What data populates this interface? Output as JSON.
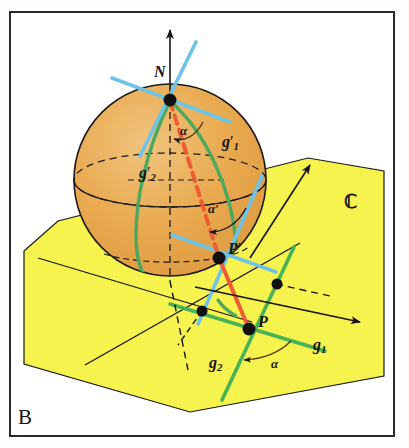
{
  "figure": {
    "panel_letter": "B",
    "caption_topic": "stereographic projection conformality",
    "background_color": "#ffffff",
    "frame_color": "#2b2b2b"
  },
  "colors": {
    "sphere_fill": "#e9a94f",
    "sphere_fill_light": "#efc078",
    "plane_fill": "#f6f24e",
    "outline": "#1a1a1a",
    "tangent_blue": "#6fc3e8",
    "great_circle_green": "#4aa85f",
    "plane_line_green": "#46b356",
    "projection_red": "#ef5b34",
    "point_black": "#111111"
  },
  "labels": {
    "north_pole": {
      "text": "N",
      "style": "italic",
      "meaning": "north-pole-of-sphere"
    },
    "point_p_prime": {
      "base": "P",
      "prime": "′",
      "meaning": "image-point-on-sphere"
    },
    "point_p": {
      "base": "P",
      "prime": "",
      "meaning": "point-in-plane"
    },
    "line_g1_prime": {
      "base": "g",
      "sub": "1",
      "prime": "′",
      "meaning": "curve-g1-on-sphere"
    },
    "line_g2_prime": {
      "base": "g",
      "sub": "2",
      "prime": "′",
      "meaning": "curve-g2-on-sphere"
    },
    "line_g1": {
      "base": "g",
      "sub": "1",
      "prime": "",
      "meaning": "line-g1-in-plane"
    },
    "line_g2": {
      "base": "g",
      "sub": "2",
      "prime": "",
      "meaning": "line-g2-in-plane"
    },
    "angle_alpha_top": {
      "text": "α",
      "meaning": "angle-at-north-pole"
    },
    "angle_alpha_prime": {
      "text": "α′",
      "meaning": "angle-at-image-point"
    },
    "angle_alpha_bottom": {
      "text": "α",
      "meaning": "angle-in-plane"
    },
    "complex_plane": {
      "text": "ℂ",
      "meaning": "complex-plane-symbol"
    }
  },
  "geometry": {
    "sphere": {
      "center_x": 170,
      "center_y": 180,
      "radius": 96
    },
    "north_pole": {
      "x": 170,
      "y": 100
    },
    "point_p_prime": {
      "x": 219,
      "y": 258
    },
    "point_p": {
      "x": 249,
      "y": 329
    },
    "plane_dot_left": {
      "x": 202,
      "y": 311
    },
    "plane_dot_right": {
      "x": 277,
      "y": 284
    }
  }
}
